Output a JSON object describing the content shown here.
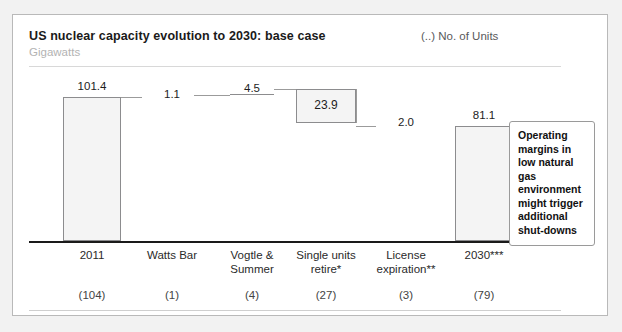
{
  "header": {
    "title": "US nuclear capacity evolution to 2030: base case",
    "subtitle": "Gigawatts",
    "units_legend": "(..) No. of Units"
  },
  "callout": {
    "text": "Operating margins in low natural gas environment might trigger additional shut-downs"
  },
  "chart_data": {
    "type": "bar",
    "subtype": "waterfall",
    "title": "US nuclear capacity evolution to 2030: base case",
    "subtitle": "Gigawatts",
    "xlabel": "",
    "ylabel": "Gigawatts",
    "ylim": [
      0,
      110
    ],
    "grid": false,
    "legend": "(..) No. of Units",
    "categories": [
      "2011",
      "Watts Bar",
      "Vogtle & Summer",
      "Single units retire*",
      "License expiration**",
      "2030***"
    ],
    "values": [
      101.4,
      1.1,
      4.5,
      -23.9,
      -2.0,
      81.1
    ],
    "value_labels": [
      "101.4",
      "1.1",
      "4.5",
      "23.9",
      "2.0",
      "81.1"
    ],
    "kinds": [
      "total",
      "increase",
      "increase",
      "decrease",
      "decrease",
      "total"
    ],
    "unit_counts": [
      "(104)",
      "(1)",
      "(4)",
      "(27)",
      "(3)",
      "(79)"
    ],
    "cumulative_start": [
      0.0,
      101.4,
      102.5,
      83.1,
      81.1,
      0.0
    ],
    "cumulative_end": [
      101.4,
      102.5,
      107.0,
      107.0,
      83.1,
      81.1
    ],
    "footnotes": [
      "*",
      "**",
      "***"
    ],
    "annotations": [
      "Operating margins in low natural gas environment might trigger additional shut-downs"
    ]
  }
}
